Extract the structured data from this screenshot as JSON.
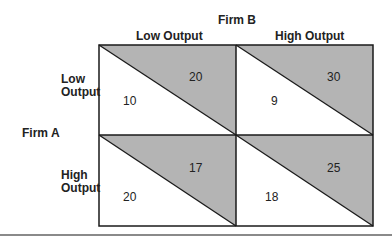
{
  "column_player": "Firm B",
  "row_player": "Firm A",
  "columns": [
    "Low Output",
    "High Output"
  ],
  "rows": [
    {
      "label_line1": "Low",
      "label_line2": "Output"
    },
    {
      "label_line1": "High",
      "label_line2": "Output"
    }
  ],
  "cells": [
    [
      {
        "firm_a": "10",
        "firm_b": "20"
      },
      {
        "firm_a": "9",
        "firm_b": "30"
      }
    ],
    [
      {
        "firm_a": "20",
        "firm_b": "17"
      },
      {
        "firm_a": "18",
        "firm_b": "25"
      }
    ]
  ],
  "colors": {
    "shade": "#b4b4b4",
    "line": "#1a1a1a"
  }
}
